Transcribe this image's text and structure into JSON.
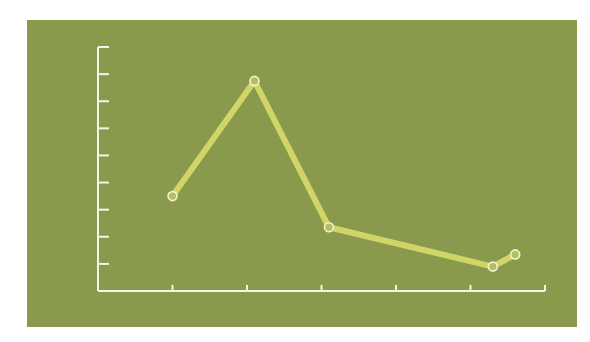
{
  "chart_data": {
    "type": "line",
    "title": "",
    "xlabel": "",
    "ylabel": "",
    "x_ticks": 6,
    "y_ticks": 9,
    "xlim": [
      0,
      6
    ],
    "ylim": [
      0,
      9
    ],
    "grid": false,
    "series": [
      {
        "name": "series-1",
        "x": [
          1.0,
          2.1,
          3.1,
          5.3,
          5.6
        ],
        "y": [
          3.5,
          7.75,
          2.35,
          0.9,
          1.35
        ]
      }
    ],
    "colors": {
      "background": "#8a9a4c",
      "axis": "#f4f4e8",
      "line": "#d8dc6a",
      "marker_fill": "#b5bf5e",
      "marker_stroke": "#f2f2d8"
    }
  }
}
